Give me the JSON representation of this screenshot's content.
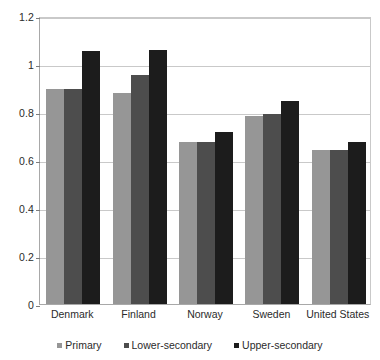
{
  "chart_data": {
    "type": "bar",
    "title": "",
    "subtitle": "",
    "xlabel": "",
    "ylabel": "",
    "categories": [
      "Denmark",
      "Finland",
      "Norway",
      "Sweden",
      "United States"
    ],
    "series": [
      {
        "name": "Primary",
        "color": "#969696",
        "values": [
          0.895,
          0.878,
          0.675,
          0.785,
          0.64
        ]
      },
      {
        "name": "Lower-secondary",
        "color": "#4d4d4d",
        "values": [
          0.895,
          0.955,
          0.675,
          0.792,
          0.64
        ]
      },
      {
        "name": "Upper-secondary",
        "color": "#1c1c1c",
        "values": [
          1.055,
          1.06,
          0.715,
          0.845,
          0.675
        ]
      }
    ],
    "ylim": [
      0,
      1.2
    ],
    "ytick_values": [
      0,
      0.2,
      0.4,
      0.6,
      0.8,
      1.0,
      1.2
    ],
    "ytick_labels": [
      "0",
      "0.2",
      "0.4",
      "0.6",
      "0.8",
      "1",
      "1.2"
    ],
    "grid": true,
    "grid_axis": "y",
    "legend_position": "bottom",
    "legend_marker": "square"
  }
}
